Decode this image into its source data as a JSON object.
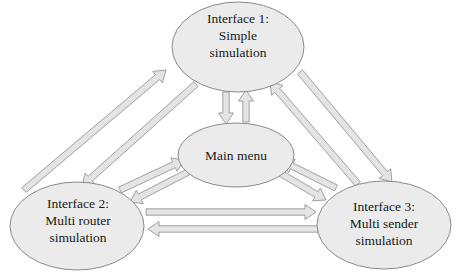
{
  "diagram": {
    "type": "navigation-flow",
    "nodes": {
      "interface1": {
        "line1": "Interface 1:",
        "line2": "Simple",
        "line3": "simulation"
      },
      "main_menu": {
        "line1": "Main menu"
      },
      "interface2": {
        "line1": "Interface 2:",
        "line2": "Multi router",
        "line3": "simulation"
      },
      "interface3": {
        "line1": "Interface 3:",
        "line2": "Multi sender",
        "line3": "simulation"
      }
    },
    "edges": [
      {
        "from": "Interface 1: Simple simulation",
        "to": "Main menu"
      },
      {
        "from": "Main menu",
        "to": "Interface 1: Simple simulation"
      },
      {
        "from": "Interface 1: Simple simulation",
        "to": "Interface 2: Multi router simulation"
      },
      {
        "from": "Interface 2: Multi router simulation",
        "to": "Interface 1: Simple simulation"
      },
      {
        "from": "Interface 1: Simple simulation",
        "to": "Interface 3: Multi sender simulation"
      },
      {
        "from": "Interface 3: Multi sender simulation",
        "to": "Interface 1: Simple simulation"
      },
      {
        "from": "Interface 2: Multi router simulation",
        "to": "Main menu"
      },
      {
        "from": "Main menu",
        "to": "Interface 2: Multi router simulation"
      },
      {
        "from": "Interface 3: Multi sender simulation",
        "to": "Main menu"
      },
      {
        "from": "Main menu",
        "to": "Interface 3: Multi sender simulation"
      },
      {
        "from": "Interface 2: Multi router simulation",
        "to": "Interface 3: Multi sender simulation"
      },
      {
        "from": "Interface 3: Multi sender simulation",
        "to": "Interface 2: Multi router simulation"
      }
    ],
    "colors": {
      "node_fill": "#ebebeb",
      "node_stroke": "#8a8a8a",
      "arrow_fill": "#e4e4e4",
      "arrow_stroke": "#8c8c8c",
      "text": "#1a1a1a"
    }
  }
}
